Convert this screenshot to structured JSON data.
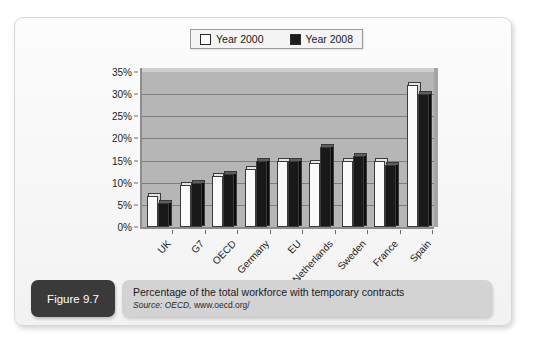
{
  "figure": {
    "tag": "Figure 9.7",
    "caption": "Percentage of the total workforce with temporary contracts",
    "source_prefix": "Source: OECD,",
    "source_url": "www.oecd.org/"
  },
  "chart_data": {
    "type": "bar",
    "title": "Percentage of the total workforce with temporary contracts",
    "xlabel": "",
    "ylabel": "",
    "ylim": [
      0,
      35
    ],
    "ytick_labels": [
      "0%",
      "5%",
      "10%",
      "15%",
      "20%",
      "25%",
      "30%",
      "35%"
    ],
    "ytick_values": [
      0,
      5,
      10,
      15,
      20,
      25,
      30,
      35
    ],
    "grid": true,
    "legend_position": "top-center",
    "categories": [
      "UK",
      "G7",
      "OECD",
      "Germany",
      "EU",
      "Netherlands",
      "Sweden",
      "France",
      "Spain"
    ],
    "series": [
      {
        "name": "Year 2000",
        "color": "#fafafa",
        "values": [
          7,
          9.5,
          11.5,
          13,
          15,
          14.5,
          15,
          15,
          32
        ]
      },
      {
        "name": "Year 2008",
        "color": "#191919",
        "values": [
          5.5,
          10,
          12,
          15,
          15,
          18,
          16,
          14,
          30
        ]
      }
    ]
  },
  "colors": {
    "plot_background": "#b6b6b6",
    "series_2000": "#fafafa",
    "series_2008": "#191919",
    "figure_tag_background": "#3a3a3a",
    "caption_background": "#d3d3d3"
  }
}
